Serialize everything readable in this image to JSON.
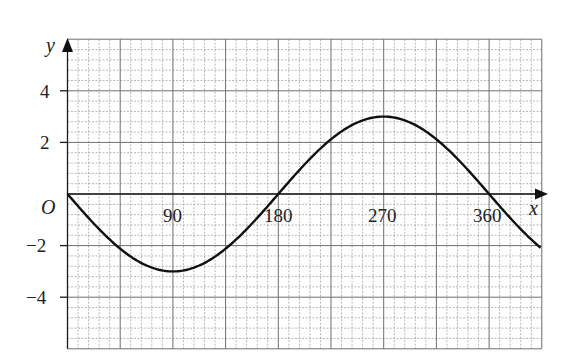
{
  "chart_data": {
    "type": "line",
    "title": "",
    "xlabel": "x",
    "ylabel": "y",
    "origin_label": "O",
    "x_tick_labels": [
      "90",
      "180",
      "270",
      "360"
    ],
    "y_tick_labels": [
      "4",
      "2",
      "-2",
      "-4"
    ],
    "xlim": [
      0,
      405
    ],
    "ylim": [
      -6,
      6
    ],
    "grid": true,
    "grid_minor_x_step": 9,
    "grid_major_x_step": 45,
    "grid_minor_y_step": 0.4,
    "grid_major_y_step": 2,
    "series": [
      {
        "name": "y = -3 sin x",
        "x": [
          0,
          45,
          90,
          135,
          180,
          225,
          270,
          315,
          360,
          405
        ],
        "values": [
          0,
          -2.12,
          -3,
          -2.12,
          0,
          2.12,
          3,
          2.12,
          0,
          -2.12
        ]
      }
    ]
  },
  "labels": {
    "x_axis": "x",
    "y_axis": "y",
    "origin": "O",
    "xt90": "90",
    "xt180": "180",
    "xt270": "270",
    "xt360": "360",
    "yt4": "4",
    "yt2": "2",
    "ytm2": "−2",
    "ytm4": "−4"
  }
}
